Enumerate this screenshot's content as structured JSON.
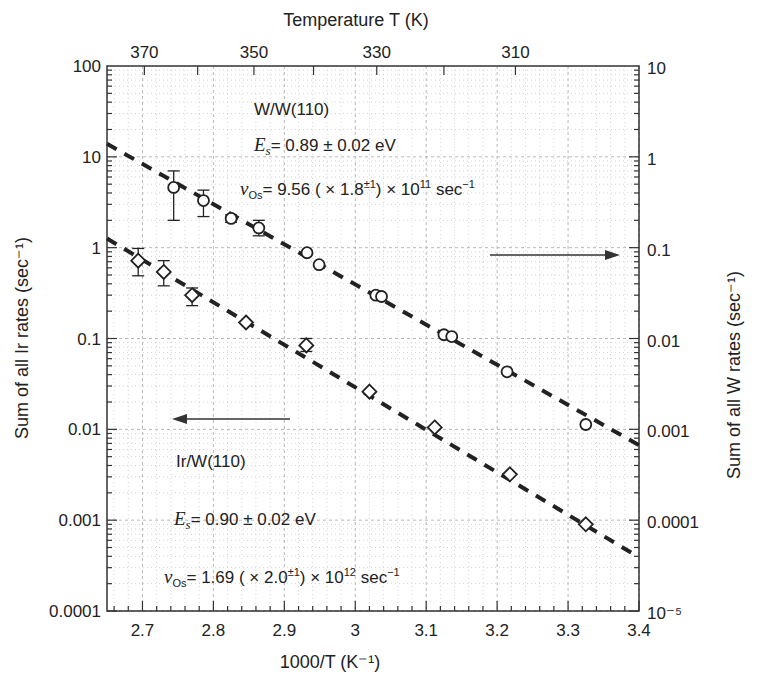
{
  "chart_data": {
    "type": "scatter",
    "title": "",
    "top_axis_title": "Temperature T (K)",
    "top_axis_ticks": [
      370,
      350,
      330,
      310
    ],
    "top_axis_minor_ticks": [
      370,
      360,
      350,
      340,
      330,
      320,
      310
    ],
    "xlabel": "1000/T (K⁻¹)",
    "xlim": [
      2.65,
      3.4
    ],
    "xticks": [
      "2.7",
      "2.8",
      "2.9",
      "3",
      "3.1",
      "3.2",
      "3.3",
      "3.4"
    ],
    "ylabel_left": "Sum of all Ir rates (sec⁻¹)",
    "ylim_left": [
      0.0001,
      100
    ],
    "yticks_left": [
      "100",
      "10",
      "1",
      "0.1",
      "0.01",
      "0.001",
      "0.0001"
    ],
    "ylabel_right": "Sum of all W rates (sec⁻¹)",
    "ylim_right": [
      1e-05,
      10
    ],
    "yticks_right": [
      "10",
      "1",
      "0.1",
      "0.01",
      "0.001",
      "0.0001",
      "10⁻⁵"
    ],
    "yscale": "log",
    "grid": true,
    "series": [
      {
        "name": "W/W(110)",
        "marker": "circle",
        "axis": "right",
        "note": "values plotted against left-axis scale; right axis = left / 10",
        "x": [
          2.744,
          2.786,
          2.825,
          2.864,
          2.932,
          2.949,
          3.029,
          3.037,
          3.125,
          3.136,
          3.214,
          3.325
        ],
        "y": [
          4.6,
          3.3,
          2.1,
          1.65,
          0.88,
          0.65,
          0.3,
          0.29,
          0.11,
          0.105,
          0.043,
          0.0113
        ],
        "y_err_low": [
          2.0,
          2.2,
          1.9,
          1.35,
          null,
          null,
          null,
          null,
          null,
          null,
          null,
          null
        ],
        "y_err_high": [
          7.0,
          4.3,
          2.3,
          2.0,
          null,
          null,
          null,
          null,
          null,
          null,
          null,
          null
        ],
        "fit": {
          "x": [
            2.65,
            3.4
          ],
          "y": [
            13.9,
            0.0067
          ]
        }
      },
      {
        "name": "Ir/W(110)",
        "marker": "diamond",
        "axis": "left",
        "x": [
          2.694,
          2.73,
          2.77,
          2.846,
          2.931,
          3.02,
          3.112,
          3.218,
          3.325
        ],
        "y": [
          0.72,
          0.54,
          0.3,
          0.15,
          0.084,
          0.026,
          0.0105,
          0.0032,
          0.0009
        ],
        "y_err_low": [
          0.49,
          0.38,
          0.23,
          null,
          0.072,
          null,
          null,
          null,
          null
        ],
        "y_err_high": [
          0.98,
          0.72,
          0.36,
          null,
          0.1,
          null,
          null,
          null,
          null
        ],
        "fit": {
          "x": [
            2.65,
            3.4
          ],
          "y": [
            1.26,
            0.00039
          ]
        }
      }
    ],
    "annotations": {
      "w_system": "W/W(110)",
      "w_es": "= 0.89 ± 0.02 eV",
      "w_nu_pre": "= 9.56 ( × 1.8",
      "w_nu_exp": "±1",
      "w_nu_post": ") × 10",
      "w_nu_pow": "11",
      "w_nu_unit": " sec",
      "ir_system": "Ir/W(110)",
      "ir_es": "= 0.90 ± 0.02 eV",
      "ir_nu_pre": "= 1.69 ( × 2.0",
      "ir_nu_exp": "±1",
      "ir_nu_post": ") × 10",
      "ir_nu_pow": "12",
      "ir_nu_unit": " sec",
      "neg1": "−1",
      "es_symbol": "E",
      "es_sub": "s",
      "nu_symbol": "ν",
      "nu_sub": "Os",
      "arrow_right_note": "W series → right axis",
      "arrow_left_note": "Ir series ← left axis"
    }
  },
  "colors": {
    "ink": "#222222",
    "grid": "#b8b8b8",
    "background": "#ffffff"
  }
}
